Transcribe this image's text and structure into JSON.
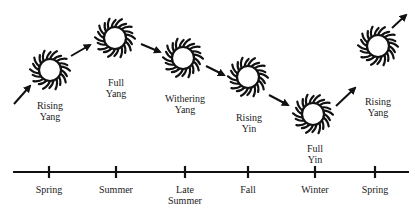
{
  "diagram": {
    "phases": [
      {
        "label": "Rising\nYang"
      },
      {
        "label": "Full\nYang"
      },
      {
        "label": "Withering\nYang"
      },
      {
        "label": "Rising\nYin"
      },
      {
        "label": "Full\nYin"
      },
      {
        "label": "Rising\nYang"
      }
    ],
    "seasons": [
      {
        "label": "Spring"
      },
      {
        "label": "Summer"
      },
      {
        "label": "Late\nSummer"
      },
      {
        "label": "Fall"
      },
      {
        "label": "Winter"
      },
      {
        "label": "Spring"
      }
    ],
    "colors": {
      "ink": "#111111",
      "text": "#222222",
      "background": "#ffffff"
    }
  }
}
